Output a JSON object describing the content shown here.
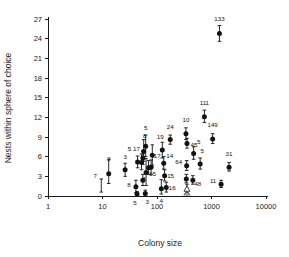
{
  "figure": {
    "background": "#ffffff",
    "marker_color": "#111111",
    "axis_color": "#1a1a1a"
  },
  "chart_data": {
    "type": "scatter",
    "title": "",
    "xlabel": "Colony size",
    "ylabel": "Nests within sphere of choice",
    "xscale": "log",
    "yscale": "linear",
    "xlim": [
      1,
      10000
    ],
    "ylim": [
      0,
      27
    ],
    "xticks": [
      1,
      10,
      100,
      1000,
      10000
    ],
    "xticklabels": [
      "1",
      "10",
      "100",
      "1000",
      "10000"
    ],
    "yticks": [
      0,
      3,
      6,
      9,
      12,
      15,
      18,
      21,
      24,
      27
    ],
    "yticklabels": [
      "0",
      "3",
      "6",
      "9",
      "12",
      "15",
      "18",
      "21",
      "24",
      "27"
    ],
    "grid": false,
    "legend": false,
    "error_bars": "vertical",
    "points": [
      {
        "label": "7",
        "x": 9.5,
        "y": 1.6,
        "yerr_low": 1.0,
        "yerr_high": 1.0,
        "marker": "none",
        "label_dx": -6,
        "label_dy": -8
      },
      {
        "label": "3",
        "x": 13,
        "y": 3.4,
        "yerr_low": 1.5,
        "yerr_high": 2.2,
        "marker": "filled",
        "label_dx": 0,
        "label_dy": -13
      },
      {
        "label": "3",
        "x": 26,
        "y": 4.0,
        "yerr_low": 1.0,
        "yerr_high": 1.0,
        "marker": "filled",
        "label_dx": 0,
        "label_dy": -11
      },
      {
        "label": "8",
        "x": 41,
        "y": 1.4,
        "yerr_low": 0.9,
        "yerr_high": 1.0,
        "marker": "filled",
        "label_dx": -7,
        "label_dy": 0
      },
      {
        "label": "5",
        "x": 43,
        "y": 0.3,
        "yerr_low": 0.3,
        "yerr_high": 0.4,
        "marker": "filled",
        "label_dx": -2,
        "label_dy": 11
      },
      {
        "label": "5",
        "x": 44,
        "y": 5.2,
        "yerr_low": 0.9,
        "yerr_high": 0.9,
        "marker": "filled",
        "label_dx": -8,
        "label_dy": -11
      },
      {
        "label": "17",
        "x": 52,
        "y": 5.1,
        "yerr_low": 1.1,
        "yerr_high": 1.3,
        "marker": "filled",
        "label_dx": -5,
        "label_dy": -12
      },
      {
        "label": "8",
        "x": 57,
        "y": 6.8,
        "yerr_low": 1.5,
        "yerr_high": 1.8,
        "marker": "filled",
        "label_dx": 1,
        "label_dy": -13
      },
      {
        "label": "5",
        "x": 62,
        "y": 7.6,
        "yerr_low": 1.6,
        "yerr_high": 1.7,
        "marker": "filled",
        "label_dx": 0,
        "label_dy": -16
      },
      {
        "label": "",
        "x": 55,
        "y": 5.8,
        "yerr_low": 1.0,
        "yerr_high": 1.1,
        "marker": "filled",
        "label_dx": 0,
        "label_dy": 0
      },
      {
        "label": "",
        "x": 55,
        "y": 2.4,
        "yerr_low": 0.8,
        "yerr_high": 0.9,
        "marker": "filled",
        "label_dx": 0,
        "label_dy": 0
      },
      {
        "label": "3",
        "x": 61,
        "y": 0.4,
        "yerr_low": 0.4,
        "yerr_high": 0.5,
        "marker": "filled",
        "label_dx": 2,
        "label_dy": 11
      },
      {
        "label": "4",
        "x": 63,
        "y": 3.6,
        "yerr_low": 2.0,
        "yerr_high": 2.1,
        "marker": "filled",
        "label_dx": -2,
        "label_dy": 9
      },
      {
        "label": "15",
        "x": 70,
        "y": 4.3,
        "yerr_low": 1.0,
        "yerr_high": 1.1,
        "marker": "filled",
        "label_dx": 4,
        "label_dy": 8
      },
      {
        "label": "17",
        "x": 82,
        "y": 6.2,
        "yerr_low": 1.5,
        "yerr_high": 1.6,
        "marker": "filled",
        "label_dx": 5,
        "label_dy": 3
      },
      {
        "label": "",
        "x": 78,
        "y": 4.4,
        "yerr_low": 1.1,
        "yerr_high": 1.1,
        "marker": "filled",
        "label_dx": 0,
        "label_dy": 0
      },
      {
        "label": "4",
        "x": 120,
        "y": 1.1,
        "yerr_low": 0.8,
        "yerr_high": 1.4,
        "marker": "filled",
        "label_dx": 0,
        "label_dy": 14
      },
      {
        "label": "19",
        "x": 125,
        "y": 7.0,
        "yerr_low": 1.2,
        "yerr_high": 1.2,
        "marker": "filled",
        "label_dx": -2,
        "label_dy": -11
      },
      {
        "label": "14",
        "x": 133,
        "y": 5.0,
        "yerr_low": 0.9,
        "yerr_high": 1.0,
        "marker": "filled",
        "label_dx": 6,
        "label_dy": -5
      },
      {
        "label": "15",
        "x": 138,
        "y": 3.1,
        "yerr_low": 0.8,
        "yerr_high": 0.9,
        "marker": "filled",
        "label_dx": 6,
        "label_dy": 2
      },
      {
        "label": "16",
        "x": 148,
        "y": 1.3,
        "yerr_low": 0.7,
        "yerr_high": 0.8,
        "marker": "filled",
        "label_dx": 6,
        "label_dy": 3
      },
      {
        "label": "24",
        "x": 175,
        "y": 8.6,
        "yerr_low": 0.7,
        "yerr_high": 0.7,
        "marker": "filled",
        "label_dx": 0,
        "label_dy": -11
      },
      {
        "label": "10",
        "x": 340,
        "y": 9.5,
        "yerr_low": 0.9,
        "yerr_high": 0.9,
        "marker": "filled",
        "label_dx": 0,
        "label_dy": -12
      },
      {
        "label": "45",
        "x": 355,
        "y": 8.0,
        "yerr_low": 0.7,
        "yerr_high": 0.8,
        "marker": "filled",
        "label_dx": 7,
        "label_dy": 3
      },
      {
        "label": "64",
        "x": 350,
        "y": 4.6,
        "yerr_low": 0.7,
        "yerr_high": 0.8,
        "marker": "filled",
        "label_dx": -8,
        "label_dy": -2
      },
      {
        "label": "",
        "x": 345,
        "y": 2.6,
        "yerr_low": 0.6,
        "yerr_high": 0.7,
        "marker": "filled",
        "label_dx": 0,
        "label_dy": 0
      },
      {
        "label": "66",
        "x": 355,
        "y": 1.1,
        "yerr_low": 0.6,
        "yerr_high": 0.7,
        "marker": "open",
        "label_dx": 0,
        "label_dy": 8
      },
      {
        "label": "5",
        "x": 470,
        "y": 6.5,
        "yerr_low": 0.9,
        "yerr_high": 1.0,
        "marker": "filled",
        "label_dx": 5,
        "label_dy": -9
      },
      {
        "label": "48",
        "x": 455,
        "y": 2.4,
        "yerr_low": 0.6,
        "yerr_high": 0.7,
        "marker": "filled",
        "label_dx": 5,
        "label_dy": 6
      },
      {
        "label": "5",
        "x": 620,
        "y": 4.9,
        "yerr_low": 0.8,
        "yerr_high": 0.9,
        "marker": "filled",
        "label_dx": 2,
        "label_dy": -11
      },
      {
        "label": "111",
        "x": 740,
        "y": 12.1,
        "yerr_low": 0.9,
        "yerr_high": 1.0,
        "marker": "filled",
        "label_dx": 0,
        "label_dy": -12
      },
      {
        "label": "149",
        "x": 1050,
        "y": 8.7,
        "yerr_low": 0.7,
        "yerr_high": 0.8,
        "marker": "filled",
        "label_dx": 0,
        "label_dy": -12
      },
      {
        "label": "133",
        "x": 1400,
        "y": 24.8,
        "yerr_low": 1.2,
        "yerr_high": 1.2,
        "marker": "filled",
        "label_dx": 0,
        "label_dy": -12
      },
      {
        "label": "11",
        "x": 1500,
        "y": 1.8,
        "yerr_low": 0.5,
        "yerr_high": 0.6,
        "marker": "filled",
        "label_dx": -8,
        "label_dy": -1
      },
      {
        "label": "31",
        "x": 2100,
        "y": 4.4,
        "yerr_low": 0.6,
        "yerr_high": 0.7,
        "marker": "filled",
        "label_dx": 0,
        "label_dy": -11
      }
    ]
  }
}
